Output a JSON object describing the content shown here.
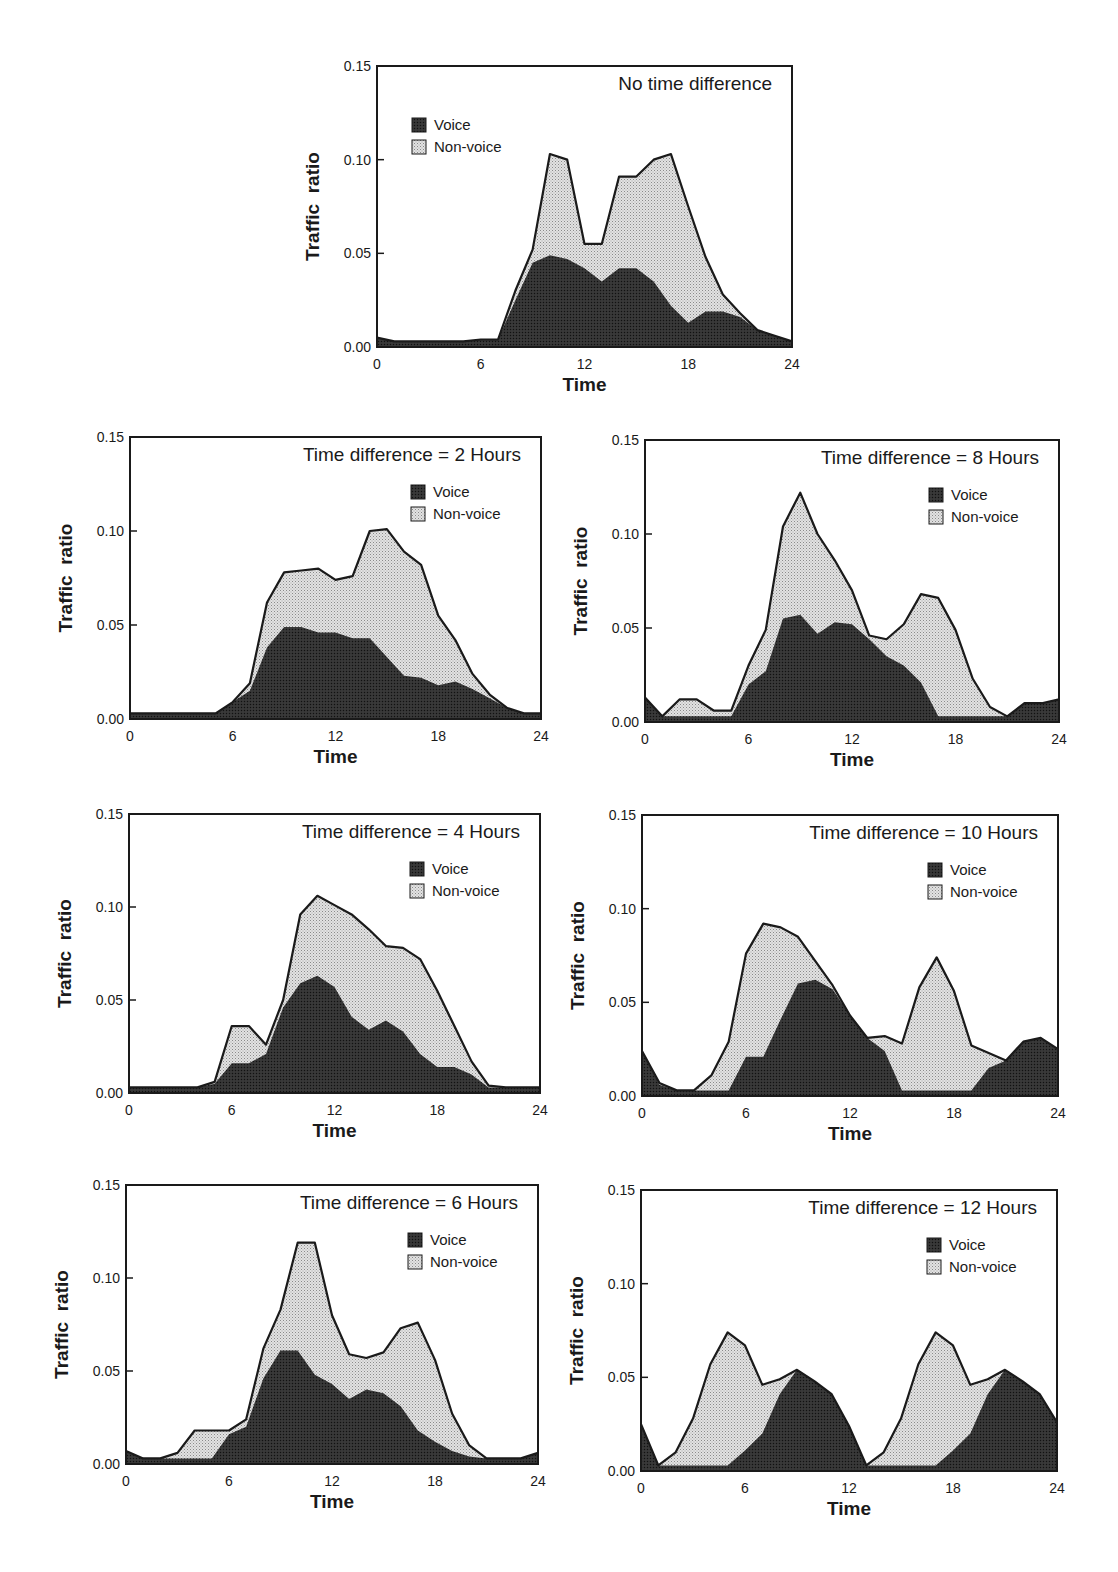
{
  "figure": {
    "x_axis_label": "Time",
    "y_axis_label": "Traffic  ratio",
    "x_ticks": [
      "0",
      "6",
      "12",
      "18",
      "24"
    ],
    "y_ticks": [
      "0.00",
      "0.05",
      "0.10",
      "0.15"
    ],
    "legend": {
      "voice": "Voice",
      "nonvoice": "Non-voice"
    },
    "colors": {
      "voice": "#2a2a2a",
      "nonvoice": "#cfcfcf",
      "outline": "#1a1a1a",
      "background": "#ffffff"
    }
  },
  "panels": [
    {
      "id": "p0",
      "title": "No time difference"
    },
    {
      "id": "p2",
      "title": "Time difference = 2 Hours"
    },
    {
      "id": "p8",
      "title": "Time difference = 8 Hours"
    },
    {
      "id": "p4",
      "title": "Time difference = 4 Hours"
    },
    {
      "id": "p10",
      "title": "Time difference = 10 Hours"
    },
    {
      "id": "p6",
      "title": "Time difference = 6 Hours"
    },
    {
      "id": "p12",
      "title": "Time difference = 12 Hours"
    }
  ],
  "chart_data": [
    {
      "type": "area",
      "stacked": true,
      "title": "No time difference",
      "xlabel": "Time",
      "ylabel": "Traffic ratio",
      "xlim": [
        0,
        24
      ],
      "ylim": [
        0,
        0.15
      ],
      "x_ticks": [
        0,
        6,
        12,
        18,
        24
      ],
      "y_ticks": [
        0.0,
        0.05,
        0.1,
        0.15
      ],
      "legend": [
        "Voice",
        "Non-voice"
      ],
      "legend_position": "upper-left",
      "x": [
        0,
        1,
        2,
        3,
        4,
        5,
        6,
        7,
        8,
        9,
        10,
        11,
        12,
        13,
        14,
        15,
        16,
        17,
        18,
        19,
        20,
        21,
        22,
        23,
        24
      ],
      "series": [
        {
          "name": "Voice",
          "values": [
            0.005,
            0.003,
            0.003,
            0.003,
            0.003,
            0.003,
            0.004,
            0.004,
            0.025,
            0.045,
            0.049,
            0.047,
            0.042,
            0.035,
            0.042,
            0.042,
            0.035,
            0.022,
            0.013,
            0.019,
            0.019,
            0.016,
            0.009,
            0.006,
            0.003
          ]
        },
        {
          "name": "Non-voice",
          "values": [
            0,
            0,
            0,
            0,
            0,
            0,
            0,
            0,
            0.005,
            0.007,
            0.054,
            0.053,
            0.013,
            0.02,
            0.049,
            0.049,
            0.065,
            0.081,
            0.062,
            0.029,
            0.009,
            0.002,
            0,
            0,
            0
          ]
        }
      ],
      "total": [
        0.005,
        0.003,
        0.003,
        0.003,
        0.003,
        0.003,
        0.004,
        0.004,
        0.03,
        0.052,
        0.103,
        0.1,
        0.055,
        0.055,
        0.091,
        0.091,
        0.1,
        0.103,
        0.075,
        0.048,
        0.028,
        0.018,
        0.009,
        0.006,
        0.003
      ]
    },
    {
      "type": "area",
      "stacked": true,
      "title": "Time difference = 2 Hours",
      "xlabel": "Time",
      "ylabel": "Traffic ratio",
      "xlim": [
        0,
        24
      ],
      "ylim": [
        0,
        0.15
      ],
      "x_ticks": [
        0,
        6,
        12,
        18,
        24
      ],
      "y_ticks": [
        0.0,
        0.05,
        0.1,
        0.15
      ],
      "legend": [
        "Voice",
        "Non-voice"
      ],
      "legend_position": "upper-right",
      "x": [
        0,
        1,
        2,
        3,
        4,
        5,
        6,
        7,
        8,
        9,
        10,
        11,
        12,
        13,
        14,
        15,
        16,
        17,
        18,
        19,
        20,
        21,
        22,
        23,
        24
      ],
      "series": [
        {
          "name": "Voice",
          "values": [
            0.003,
            0.003,
            0.003,
            0.003,
            0.003,
            0.003,
            0.009,
            0.015,
            0.038,
            0.049,
            0.049,
            0.046,
            0.046,
            0.043,
            0.043,
            0.033,
            0.023,
            0.022,
            0.018,
            0.02,
            0.016,
            0.011,
            0.006,
            0.003,
            0.003
          ]
        },
        {
          "name": "Non-voice",
          "values": [
            0,
            0,
            0,
            0,
            0,
            0,
            0,
            0.004,
            0.024,
            0.029,
            0.03,
            0.034,
            0.028,
            0.033,
            0.057,
            0.068,
            0.066,
            0.06,
            0.037,
            0.022,
            0.008,
            0.002,
            0,
            0,
            0
          ]
        }
      ],
      "total": [
        0.003,
        0.003,
        0.003,
        0.003,
        0.003,
        0.003,
        0.009,
        0.019,
        0.062,
        0.078,
        0.079,
        0.08,
        0.074,
        0.076,
        0.1,
        0.101,
        0.089,
        0.082,
        0.055,
        0.042,
        0.024,
        0.013,
        0.006,
        0.003,
        0.003
      ]
    },
    {
      "type": "area",
      "stacked": true,
      "title": "Time difference = 8 Hours",
      "xlabel": "Time",
      "ylabel": "Traffic ratio",
      "xlim": [
        0,
        24
      ],
      "ylim": [
        0,
        0.15
      ],
      "x_ticks": [
        0,
        6,
        12,
        18,
        24
      ],
      "y_ticks": [
        0.0,
        0.05,
        0.1,
        0.15
      ],
      "legend": [
        "Voice",
        "Non-voice"
      ],
      "legend_position": "upper-right",
      "x": [
        0,
        1,
        2,
        3,
        4,
        5,
        6,
        7,
        8,
        9,
        10,
        11,
        12,
        13,
        14,
        15,
        16,
        17,
        18,
        19,
        20,
        21,
        22,
        23,
        24
      ],
      "series": [
        {
          "name": "Voice",
          "values": [
            0.013,
            0.003,
            0.003,
            0.003,
            0.003,
            0.003,
            0.02,
            0.027,
            0.055,
            0.057,
            0.047,
            0.053,
            0.052,
            0.044,
            0.035,
            0.03,
            0.021,
            0.003,
            0.003,
            0.003,
            0.003,
            0.003,
            0.01,
            0.01,
            0.012
          ]
        },
        {
          "name": "Non-voice",
          "values": [
            0,
            0,
            0.009,
            0.009,
            0.003,
            0.003,
            0.01,
            0.022,
            0.049,
            0.065,
            0.053,
            0.033,
            0.018,
            0.002,
            0.009,
            0.022,
            0.047,
            0.063,
            0.046,
            0.02,
            0.005,
            0,
            0,
            0,
            0
          ]
        }
      ],
      "total": [
        0.013,
        0.003,
        0.012,
        0.012,
        0.006,
        0.006,
        0.03,
        0.049,
        0.104,
        0.122,
        0.1,
        0.086,
        0.07,
        0.046,
        0.044,
        0.052,
        0.068,
        0.066,
        0.049,
        0.023,
        0.008,
        0.003,
        0.01,
        0.01,
        0.012
      ]
    },
    {
      "type": "area",
      "stacked": true,
      "title": "Time difference = 4 Hours",
      "xlabel": "Time",
      "ylabel": "Traffic ratio",
      "xlim": [
        0,
        24
      ],
      "ylim": [
        0,
        0.15
      ],
      "x_ticks": [
        0,
        6,
        12,
        18,
        24
      ],
      "y_ticks": [
        0.0,
        0.05,
        0.1,
        0.15
      ],
      "legend": [
        "Voice",
        "Non-voice"
      ],
      "legend_position": "upper-right",
      "x": [
        0,
        1,
        2,
        3,
        4,
        5,
        6,
        7,
        8,
        9,
        10,
        11,
        12,
        13,
        14,
        15,
        16,
        17,
        18,
        19,
        20,
        21,
        22,
        23,
        24
      ],
      "series": [
        {
          "name": "Voice",
          "values": [
            0.003,
            0.003,
            0.003,
            0.003,
            0.003,
            0.005,
            0.016,
            0.016,
            0.021,
            0.046,
            0.059,
            0.063,
            0.057,
            0.041,
            0.034,
            0.039,
            0.033,
            0.021,
            0.014,
            0.014,
            0.01,
            0.003,
            0.003,
            0.003,
            0.003
          ]
        },
        {
          "name": "Non-voice",
          "values": [
            0,
            0,
            0,
            0,
            0,
            0.001,
            0.02,
            0.02,
            0.005,
            0.004,
            0.037,
            0.043,
            0.044,
            0.055,
            0.054,
            0.04,
            0.045,
            0.051,
            0.041,
            0.022,
            0.007,
            0.001,
            0,
            0,
            0
          ]
        }
      ],
      "total": [
        0.003,
        0.003,
        0.003,
        0.003,
        0.003,
        0.006,
        0.036,
        0.036,
        0.026,
        0.05,
        0.096,
        0.106,
        0.101,
        0.096,
        0.088,
        0.079,
        0.078,
        0.072,
        0.055,
        0.036,
        0.017,
        0.004,
        0.003,
        0.003,
        0.003
      ]
    },
    {
      "type": "area",
      "stacked": true,
      "title": "Time difference = 10 Hours",
      "xlabel": "Time",
      "ylabel": "Traffic ratio",
      "xlim": [
        0,
        24
      ],
      "ylim": [
        0,
        0.15
      ],
      "x_ticks": [
        0,
        6,
        12,
        18,
        24
      ],
      "y_ticks": [
        0.0,
        0.05,
        0.1,
        0.15
      ],
      "legend": [
        "Voice",
        "Non-voice"
      ],
      "legend_position": "upper-right",
      "x": [
        0,
        1,
        2,
        3,
        4,
        5,
        6,
        7,
        8,
        9,
        10,
        11,
        12,
        13,
        14,
        15,
        16,
        17,
        18,
        19,
        20,
        21,
        22,
        23,
        24
      ],
      "series": [
        {
          "name": "Voice",
          "values": [
            0.024,
            0.006,
            0.003,
            0.003,
            0.003,
            0.003,
            0.021,
            0.021,
            0.041,
            0.06,
            0.062,
            0.057,
            0.043,
            0.031,
            0.024,
            0.003,
            0.003,
            0.003,
            0.003,
            0.003,
            0.015,
            0.019,
            0.029,
            0.031,
            0.025
          ]
        },
        {
          "name": "Non-voice",
          "values": [
            0,
            0.001,
            0,
            0,
            0.008,
            0.026,
            0.055,
            0.071,
            0.049,
            0.025,
            0.01,
            0.002,
            0,
            0,
            0.008,
            0.025,
            0.055,
            0.071,
            0.053,
            0.024,
            0.008,
            0,
            0,
            0,
            0
          ]
        }
      ],
      "total": [
        0.024,
        0.007,
        0.003,
        0.003,
        0.011,
        0.029,
        0.076,
        0.092,
        0.09,
        0.085,
        0.072,
        0.059,
        0.043,
        0.031,
        0.032,
        0.028,
        0.058,
        0.074,
        0.056,
        0.027,
        0.023,
        0.019,
        0.029,
        0.031,
        0.025
      ]
    },
    {
      "type": "area",
      "stacked": true,
      "title": "Time difference = 6 Hours",
      "xlabel": "Time",
      "ylabel": "Traffic ratio",
      "xlim": [
        0,
        24
      ],
      "ylim": [
        0,
        0.15
      ],
      "x_ticks": [
        0,
        6,
        12,
        18,
        24
      ],
      "y_ticks": [
        0.0,
        0.05,
        0.1,
        0.15
      ],
      "legend": [
        "Voice",
        "Non-voice"
      ],
      "legend_position": "upper-right",
      "x": [
        0,
        1,
        2,
        3,
        4,
        5,
        6,
        7,
        8,
        9,
        10,
        11,
        12,
        13,
        14,
        15,
        16,
        17,
        18,
        19,
        20,
        21,
        22,
        23,
        24
      ],
      "series": [
        {
          "name": "Voice",
          "values": [
            0.007,
            0.003,
            0.003,
            0.003,
            0.003,
            0.003,
            0.016,
            0.02,
            0.046,
            0.061,
            0.061,
            0.048,
            0.043,
            0.035,
            0.04,
            0.038,
            0.031,
            0.018,
            0.012,
            0.007,
            0.004,
            0.003,
            0.003,
            0.003,
            0.006
          ]
        },
        {
          "name": "Non-voice",
          "values": [
            0,
            0,
            0,
            0.003,
            0.015,
            0.015,
            0.002,
            0.004,
            0.016,
            0.022,
            0.058,
            0.071,
            0.037,
            0.024,
            0.017,
            0.022,
            0.042,
            0.058,
            0.044,
            0.02,
            0.006,
            0.0,
            0,
            0,
            0
          ]
        }
      ],
      "total": [
        0.007,
        0.003,
        0.003,
        0.006,
        0.018,
        0.018,
        0.018,
        0.024,
        0.062,
        0.083,
        0.119,
        0.119,
        0.08,
        0.059,
        0.057,
        0.06,
        0.073,
        0.076,
        0.056,
        0.027,
        0.01,
        0.003,
        0.003,
        0.003,
        0.006
      ]
    },
    {
      "type": "area",
      "stacked": true,
      "title": "Time difference = 12 Hours",
      "xlabel": "Time",
      "ylabel": "Traffic ratio",
      "xlim": [
        0,
        24
      ],
      "ylim": [
        0,
        0.15
      ],
      "x_ticks": [
        0,
        6,
        12,
        18,
        24
      ],
      "y_ticks": [
        0.0,
        0.05,
        0.1,
        0.15
      ],
      "legend": [
        "Voice",
        "Non-voice"
      ],
      "legend_position": "upper-right",
      "x": [
        0,
        1,
        2,
        3,
        4,
        5,
        6,
        7,
        8,
        9,
        10,
        11,
        12,
        13,
        14,
        15,
        16,
        17,
        18,
        19,
        20,
        21,
        22,
        23,
        24
      ],
      "series": [
        {
          "name": "Voice",
          "values": [
            0.025,
            0.003,
            0.003,
            0.003,
            0.003,
            0.003,
            0.011,
            0.02,
            0.041,
            0.054,
            0.048,
            0.041,
            0.024,
            0.003,
            0.003,
            0.003,
            0.003,
            0.003,
            0.011,
            0.02,
            0.041,
            0.054,
            0.048,
            0.041,
            0.026
          ]
        },
        {
          "name": "Non-voice",
          "values": [
            0,
            0,
            0.007,
            0.025,
            0.054,
            0.071,
            0.056,
            0.026,
            0.008,
            0,
            0,
            0,
            0,
            0,
            0.007,
            0.025,
            0.054,
            0.071,
            0.056,
            0.026,
            0.008,
            0,
            0,
            0,
            0
          ]
        }
      ],
      "total": [
        0.025,
        0.003,
        0.01,
        0.028,
        0.057,
        0.074,
        0.067,
        0.046,
        0.049,
        0.054,
        0.048,
        0.041,
        0.024,
        0.003,
        0.01,
        0.028,
        0.057,
        0.074,
        0.067,
        0.046,
        0.049,
        0.054,
        0.048,
        0.041,
        0.026
      ]
    }
  ]
}
